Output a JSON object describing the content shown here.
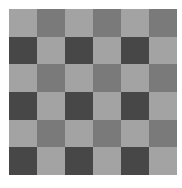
{
  "pattern": {
    "rows": 6,
    "cols": 6,
    "colors": {
      "light": "#a3a3a3",
      "medium": "#7a7a7a",
      "dark": "#474747"
    },
    "cells": [
      [
        "light",
        "medium",
        "light",
        "medium",
        "light",
        "medium"
      ],
      [
        "dark",
        "light",
        "dark",
        "light",
        "dark",
        "light"
      ],
      [
        "light",
        "medium",
        "light",
        "medium",
        "light",
        "medium"
      ],
      [
        "dark",
        "light",
        "dark",
        "light",
        "dark",
        "light"
      ],
      [
        "light",
        "medium",
        "light",
        "medium",
        "light",
        "medium"
      ],
      [
        "dark",
        "light",
        "dark",
        "light",
        "dark",
        "light"
      ]
    ]
  }
}
